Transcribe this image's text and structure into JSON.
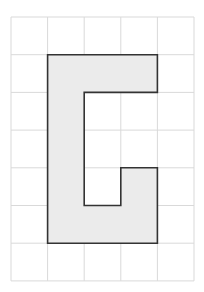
{
  "grid": {
    "cols": 5,
    "rows": 7,
    "x0": 11,
    "y0": 17,
    "cell_w": 36.6,
    "cell_h": 37.7,
    "line_color": "#d9d9d9"
  },
  "shape": {
    "fill": "#ebebeb",
    "stroke": "#333333",
    "vertices_grid": [
      [
        1,
        1
      ],
      [
        4,
        1
      ],
      [
        4,
        2
      ],
      [
        2,
        2
      ],
      [
        2,
        5
      ],
      [
        3,
        5
      ],
      [
        3,
        4
      ],
      [
        4,
        4
      ],
      [
        4,
        6
      ],
      [
        1,
        6
      ]
    ]
  }
}
